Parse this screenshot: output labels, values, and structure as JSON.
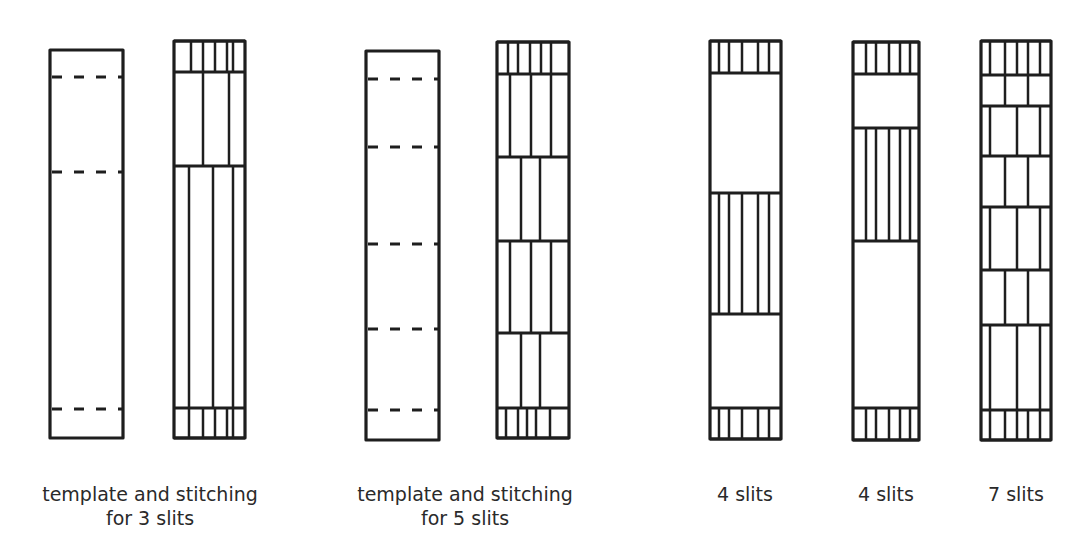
{
  "diagram": {
    "stroke_color": "#1e1e1e",
    "background": "#ffffff",
    "panels": [
      {
        "id": "template-3-slits",
        "kind": "template",
        "x1": 50,
        "x2": 123,
        "y1": 50,
        "y2": 438,
        "dashed_lines": [
          77,
          172,
          409
        ],
        "sections": []
      },
      {
        "id": "stitching-3-slits",
        "kind": "stitching",
        "x1": 174,
        "x2": 245,
        "y1": 41,
        "y2": 438,
        "rows": [
          41,
          72,
          166,
          408,
          438
        ],
        "sections": [
          {
            "y1": 41,
            "y2": 72,
            "verticals": [
              191,
              203,
              215,
              227,
              233
            ]
          },
          {
            "y1": 72,
            "y2": 166,
            "verticals": [
              203,
              229
            ]
          },
          {
            "y1": 166,
            "y2": 408,
            "verticals": [
              189,
              213,
              233
            ]
          },
          {
            "y1": 408,
            "y2": 438,
            "verticals": [
              189,
              203,
              215,
              227,
              233
            ]
          }
        ]
      },
      {
        "id": "template-5-slits",
        "kind": "template",
        "x1": 366,
        "x2": 439,
        "y1": 51,
        "y2": 440,
        "dashed_lines": [
          79,
          147,
          244,
          329,
          410
        ],
        "sections": []
      },
      {
        "id": "stitching-5-slits",
        "kind": "stitching",
        "x1": 497,
        "x2": 569,
        "y1": 42,
        "y2": 438,
        "rows": [
          42,
          74,
          157,
          241,
          333,
          408,
          438
        ],
        "sections": [
          {
            "y1": 42,
            "y2": 74,
            "verticals": [
              508,
              518,
              530,
              541,
              551
            ]
          },
          {
            "y1": 74,
            "y2": 157,
            "verticals": [
              510,
              531,
              551
            ]
          },
          {
            "y1": 157,
            "y2": 241,
            "verticals": [
              521,
              540
            ]
          },
          {
            "y1": 241,
            "y2": 333,
            "verticals": [
              510,
              531,
              551
            ]
          },
          {
            "y1": 333,
            "y2": 408,
            "verticals": [
              521,
              540
            ]
          },
          {
            "y1": 408,
            "y2": 438,
            "verticals": [
              506,
              518,
              527,
              536,
              550
            ]
          }
        ]
      },
      {
        "id": "slits-4-a",
        "kind": "stitching",
        "x1": 710,
        "x2": 781,
        "y1": 41,
        "y2": 439,
        "rows": [
          41,
          73,
          193,
          314,
          408,
          439
        ],
        "sections": [
          {
            "y1": 41,
            "y2": 73,
            "verticals": [
              719,
              729,
              742,
              758,
              769
            ]
          },
          {
            "y1": 73,
            "y2": 193,
            "verticals": []
          },
          {
            "y1": 193,
            "y2": 314,
            "verticals": [
              719,
              729,
              742,
              758,
              769
            ]
          },
          {
            "y1": 314,
            "y2": 408,
            "verticals": []
          },
          {
            "y1": 408,
            "y2": 439,
            "verticals": [
              719,
              729,
              742,
              758,
              769
            ]
          }
        ]
      },
      {
        "id": "slits-4-b",
        "kind": "stitching",
        "x1": 853,
        "x2": 919,
        "y1": 42,
        "y2": 440,
        "rows": [
          42,
          74,
          128,
          241,
          408,
          440
        ],
        "sections": [
          {
            "y1": 42,
            "y2": 74,
            "verticals": [
              866,
              876,
              889,
              900,
              910
            ]
          },
          {
            "y1": 74,
            "y2": 128,
            "verticals": []
          },
          {
            "y1": 128,
            "y2": 241,
            "verticals": [
              866,
              876,
              889,
              900,
              910
            ]
          },
          {
            "y1": 241,
            "y2": 408,
            "verticals": []
          },
          {
            "y1": 408,
            "y2": 440,
            "verticals": [
              866,
              876,
              889,
              900,
              910
            ]
          }
        ]
      },
      {
        "id": "slits-7",
        "kind": "stitching",
        "x1": 981,
        "x2": 1051,
        "y1": 41,
        "y2": 440,
        "rows": [
          41,
          75,
          106,
          156,
          207,
          270,
          325,
          410,
          440
        ],
        "sections": [
          {
            "y1": 41,
            "y2": 75,
            "verticals": [
              990,
              1005,
              1017,
              1028,
              1040
            ]
          },
          {
            "y1": 75,
            "y2": 106,
            "verticals": [
              1005,
              1028
            ]
          },
          {
            "y1": 106,
            "y2": 156,
            "verticals": [
              990,
              1017,
              1040
            ]
          },
          {
            "y1": 156,
            "y2": 207,
            "verticals": [
              1005,
              1028
            ]
          },
          {
            "y1": 207,
            "y2": 270,
            "verticals": [
              990,
              1017,
              1040
            ]
          },
          {
            "y1": 270,
            "y2": 325,
            "verticals": [
              1005,
              1028
            ]
          },
          {
            "y1": 325,
            "y2": 410,
            "verticals": [
              990,
              1017,
              1040
            ]
          },
          {
            "y1": 410,
            "y2": 440,
            "verticals": [
              990,
              1005,
              1017,
              1028,
              1040
            ]
          }
        ]
      }
    ]
  },
  "captions": {
    "group_3_slits": {
      "line1": "template and stitching",
      "line2": "for 3 slits"
    },
    "group_5_slits": {
      "line1": "template and stitching",
      "line2": "for 5 slits"
    },
    "slits_4_a": "4 slits",
    "slits_4_b": "4 slits",
    "slits_7": "7 slits"
  }
}
